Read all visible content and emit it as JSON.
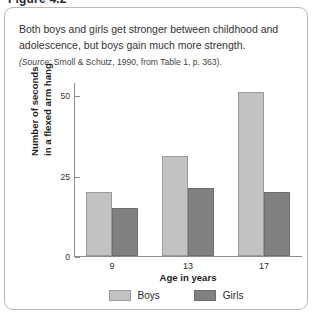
{
  "figure": {
    "number_label": "Figure 4.2",
    "caption": "Both boys and girls get stronger between childhood and adolescence, but boys gain much more strength.",
    "source_prefix": "(Source:",
    "source_text": " Smoll & Schutz, 1990, from Table 1, p. 363)."
  },
  "colors": {
    "boys": "#c2c2c2",
    "girls": "#808080",
    "axis": "#8d8d8d",
    "panel_border": "#b9b9b9"
  },
  "legend": {
    "items": [
      {
        "label": "Boys",
        "color_key": "boys"
      },
      {
        "label": "Girls",
        "color_key": "girls"
      }
    ]
  },
  "chart_data": {
    "type": "bar",
    "title": "",
    "subtitle": "",
    "xlabel": "Age in years",
    "ylabel": "Number of seconds in a flexed arm hang",
    "ylabel_line1": "Number of seconds",
    "ylabel_line2": "in a flexed arm hang",
    "categories": [
      "9",
      "13",
      "17"
    ],
    "ytick_labels": [
      "0",
      "25",
      "50"
    ],
    "yticks": [
      0,
      25,
      50
    ],
    "ylim": [
      0,
      54
    ],
    "grid": false,
    "legend_position": "bottom-center",
    "series": [
      {
        "name": "Boys",
        "values": [
          20,
          31,
          51
        ],
        "color": "#c2c2c2"
      },
      {
        "name": "Girls",
        "values": [
          15,
          21,
          20
        ],
        "color": "#808080"
      }
    ]
  }
}
